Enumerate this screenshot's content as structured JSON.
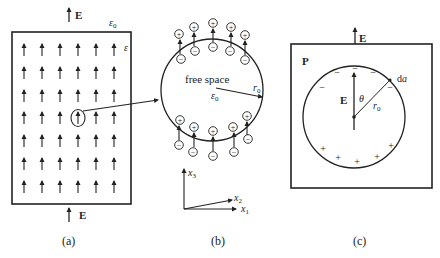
{
  "figure": {
    "panel_a": {
      "caption": "(a)",
      "field_label_top": "E",
      "field_label_bottom": "E",
      "outer_medium_label": "ε",
      "outer_medium_sub": "0",
      "inner_medium_label": "ε",
      "arrow_grid": {
        "rows": 7,
        "cols": 6
      }
    },
    "panel_b": {
      "caption": "(b)",
      "region_label": "free space",
      "permittivity_label": "ε",
      "permittivity_sub": "0",
      "radius_label": "r",
      "radius_sub": "0",
      "charge_plus": "+",
      "charge_minus": "−",
      "axes": {
        "x1": "x",
        "x1_sub": "1",
        "x2": "x",
        "x2_sub": "2",
        "x3": "x",
        "x3_sub": "3"
      }
    },
    "panel_c": {
      "caption": "(c)",
      "polarization_label": "P",
      "field_label_top": "E",
      "field_label_inner": "E",
      "angle_label": "θ",
      "radius_label": "r",
      "radius_sub": "0",
      "area_element_label": "da",
      "area_d": "d",
      "area_a": "a",
      "charge_plus": "+",
      "charge_minus": "−"
    },
    "colors": {
      "stroke": "#222222",
      "background": "#ffffff"
    }
  }
}
